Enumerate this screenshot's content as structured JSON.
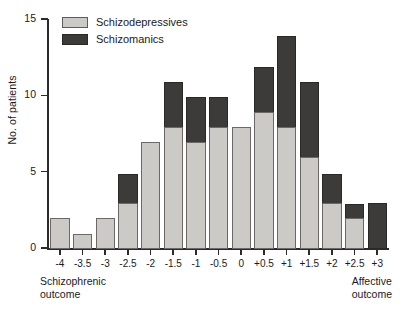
{
  "chart_data": {
    "type": "bar",
    "title": "",
    "subtitle": "",
    "xlabel": "",
    "ylabel": "No. of patients",
    "stacked": true,
    "grid": false,
    "legend_position": "top-left",
    "ylim": [
      0,
      15
    ],
    "yticks": [
      0,
      5,
      10,
      15
    ],
    "ytick_labels": [
      "0",
      "5",
      "10",
      "15"
    ],
    "categories": [
      "-4",
      "-3.5",
      "-3",
      "-2.5",
      "-2",
      "-1.5",
      "-1",
      "-0.5",
      "0",
      "+0.5",
      "+1",
      "+1.5",
      "+2",
      "+2.5",
      "+3"
    ],
    "series": [
      {
        "name": "Schizodepressives",
        "color": "#cccac7",
        "values": [
          2,
          1,
          2,
          3,
          7,
          8,
          7,
          8,
          8,
          9,
          8,
          6,
          3,
          2,
          0
        ]
      },
      {
        "name": "Schizomanics",
        "color": "#3d3a3a",
        "values": [
          0,
          0,
          0,
          2,
          0,
          3,
          3,
          2,
          0,
          3,
          6,
          5,
          2,
          1,
          3
        ]
      }
    ],
    "totals": [
      2,
      1,
      2,
      5,
      7,
      11,
      10,
      10,
      8,
      12,
      14,
      11,
      5,
      3,
      3
    ],
    "annotations": [
      {
        "name": "left-axis-note",
        "text_line1": "Schizophrenic",
        "text_line2": "outcome",
        "position": "bottom-left"
      },
      {
        "name": "right-axis-note",
        "text_line1": "Affective",
        "text_line2": "outcome",
        "position": "bottom-right"
      }
    ]
  },
  "legend": {
    "items": [
      {
        "label": "Schizodepressives",
        "swatch": "light"
      },
      {
        "label": "Schizomanics",
        "swatch": "dark"
      }
    ]
  },
  "notes": {
    "left_line1": "Schizophrenic",
    "left_line2": "outcome",
    "right_line1": "Affective",
    "right_line2": "outcome"
  },
  "axis": {
    "y_title": "No. of patients"
  }
}
